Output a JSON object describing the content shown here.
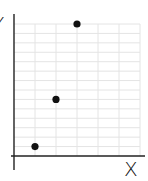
{
  "chart_data": {
    "type": "scatter",
    "title": "",
    "xlabel": "X",
    "ylabel": "Y",
    "x": [
      1,
      2,
      3
    ],
    "y": [
      1,
      6,
      14
    ],
    "series": [
      {
        "name": "points",
        "x": [
          1,
          2,
          3
        ],
        "y": [
          1,
          6,
          14
        ]
      }
    ],
    "xlim": [
      0,
      6
    ],
    "ylim": [
      0,
      14
    ],
    "grid": true,
    "legend": null,
    "tick_labels_shown": false
  },
  "style": {
    "grid_color": "#e4e4e4",
    "axis_color": "#222222",
    "point_color": "#111111"
  }
}
